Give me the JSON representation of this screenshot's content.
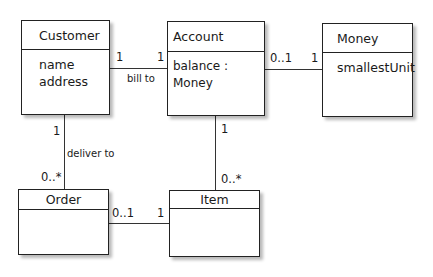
{
  "diagram": {
    "type": "UML class diagram",
    "classes": [
      {
        "id": "customer",
        "name": "Customer",
        "attributes": [
          "name",
          "address"
        ]
      },
      {
        "id": "account",
        "name": "Account",
        "attributes": [
          "balance : Money"
        ]
      },
      {
        "id": "money",
        "name": "Money",
        "attributes": [
          "smallestUnit"
        ]
      },
      {
        "id": "order",
        "name": "Order",
        "attributes": []
      },
      {
        "id": "item",
        "name": "Item",
        "attributes": []
      }
    ],
    "associations": [
      {
        "from": "Customer",
        "to": "Account",
        "label": "bill to",
        "from_mult": "1",
        "to_mult": "1"
      },
      {
        "from": "Account",
        "to": "Money",
        "label": "",
        "from_mult": "0..1",
        "to_mult": "1"
      },
      {
        "from": "Customer",
        "to": "Order",
        "label": "deliver to",
        "from_mult": "1",
        "to_mult": "0..*"
      },
      {
        "from": "Account",
        "to": "Item",
        "label": "",
        "from_mult": "1",
        "to_mult": "0..*"
      },
      {
        "from": "Order",
        "to": "Item",
        "label": "",
        "from_mult": "0..1",
        "to_mult": "1"
      }
    ]
  }
}
